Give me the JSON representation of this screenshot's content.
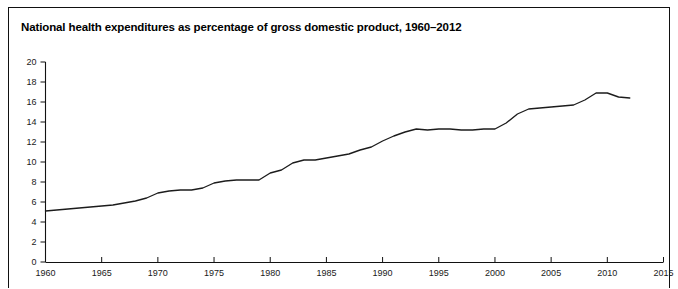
{
  "chart_data": {
    "type": "line",
    "title": "National health expenditures as percentage of gross domestic product, 1960–2012",
    "xlabel": "",
    "ylabel": "",
    "xlim": [
      1960,
      2015
    ],
    "ylim": [
      0,
      20
    ],
    "grid": false,
    "legend": false,
    "y_ticks": [
      0,
      2,
      4,
      6,
      8,
      10,
      12,
      14,
      16,
      18,
      20
    ],
    "y_tick_labels": [
      "0",
      "2",
      "4",
      "6",
      "8",
      "10",
      "12",
      "14",
      "16",
      "18",
      "20"
    ],
    "x_ticks": [
      1960,
      1965,
      1970,
      1975,
      1980,
      1985,
      1990,
      1995,
      2000,
      2005,
      2010,
      2015
    ],
    "x_tick_labels": [
      "1960",
      "1965",
      "1970",
      "1975",
      "1980",
      "1985",
      "1990",
      "1995",
      "2000",
      "2005",
      "2010",
      "2015"
    ],
    "series": [
      {
        "name": "National health expenditures as percentage of GDP",
        "x": [
          1960,
          1961,
          1962,
          1963,
          1964,
          1965,
          1966,
          1967,
          1968,
          1969,
          1970,
          1971,
          1972,
          1973,
          1974,
          1975,
          1976,
          1977,
          1978,
          1979,
          1980,
          1981,
          1982,
          1983,
          1984,
          1985,
          1986,
          1987,
          1988,
          1989,
          1990,
          1991,
          1992,
          1993,
          1994,
          1995,
          1996,
          1997,
          1998,
          1999,
          2000,
          2001,
          2002,
          2003,
          2004,
          2005,
          2006,
          2007,
          2008,
          2009,
          2010,
          2011,
          2012
        ],
        "values": [
          5.1,
          5.2,
          5.3,
          5.4,
          5.5,
          5.6,
          5.7,
          5.9,
          6.1,
          6.4,
          6.9,
          7.1,
          7.2,
          7.2,
          7.4,
          7.9,
          8.1,
          8.2,
          8.2,
          8.2,
          8.9,
          9.2,
          9.9,
          10.2,
          10.2,
          10.4,
          10.6,
          10.8,
          11.2,
          11.5,
          12.1,
          12.6,
          13.0,
          13.3,
          13.2,
          13.3,
          13.3,
          13.2,
          13.2,
          13.3,
          13.3,
          13.9,
          14.8,
          15.3,
          15.4,
          15.5,
          15.6,
          15.7,
          16.2,
          16.9,
          16.9,
          16.5,
          16.4
        ]
      }
    ]
  },
  "figure": {
    "title_text": "National health expenditures as percentage of gross domestic product, 1960–2012",
    "line_color": "#1c1c1c",
    "axis_color": "#111111",
    "background_color": "#ffffff",
    "border_color": "#111111"
  }
}
